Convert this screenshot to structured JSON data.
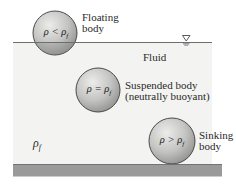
{
  "diagram": {
    "surface_symbol": "water-surface-triangle",
    "fluid_label": "Fluid",
    "fluid_density_label": {
      "symbol": "ρ",
      "subscript": "f"
    },
    "bodies": [
      {
        "id": "floating",
        "condition": {
          "lhs": "ρ",
          "op": "<",
          "rhs": "ρ",
          "rhs_sub": "f"
        },
        "caption_line1": "Floating",
        "caption_line2": "body"
      },
      {
        "id": "suspended",
        "condition": {
          "lhs": "ρ",
          "op": "=",
          "rhs": "ρ",
          "rhs_sub": "f"
        },
        "caption_line1": "Suspended body",
        "caption_line2": "(neutrally buoyant)"
      },
      {
        "id": "sinking",
        "condition": {
          "lhs": "ρ",
          "op": ">",
          "rhs": "ρ",
          "rhs_sub": "f"
        },
        "caption_line1": "Sinking",
        "caption_line2": "body"
      }
    ],
    "colors": {
      "fluid": "#f2f2f0",
      "surface_line": "#6e6e6e",
      "floor": "#9a9a9a",
      "ball_light": "#e4e4e2",
      "ball_dark": "#9c9c9a",
      "ball_stroke": "#3a3a3a"
    }
  }
}
